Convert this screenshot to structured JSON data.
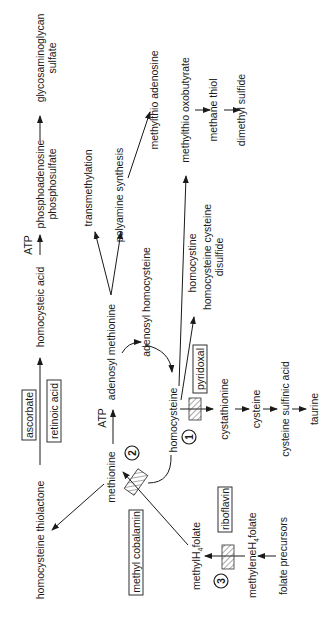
{
  "diagram": {
    "orientation": "rotated-90-ccw",
    "nodes": {
      "glycosaminoglycan_sulfate_1": "glycosaminoglycan",
      "glycosaminoglycan_sulfate_2": "sulfate",
      "paps_1": "phosphoadenosine",
      "paps_2": "phosphosulfate",
      "homocysteic_acid": "homocysteic acid",
      "atp_top": "ATP",
      "ascorbate": "ascorbate",
      "retinoic_acid": "retinoic acid",
      "homocysteine_thiolactone": "homocysteine thiolactone",
      "transmethylation": "transmethylation",
      "polyamine_synthesis": "polyamine synthesis",
      "methylthio_adenosine": "methylthio adenosine",
      "methylthio_oxobutyrate": "methylthio oxobutyrate",
      "methane_thiol": "methane thiol",
      "dimethyl_sulfide": "dimethyl sulfide",
      "adenosyl_methionine": "adenosyl methionine",
      "atp_mid": "ATP",
      "methionine": "methionine",
      "adenosyl_homocysteine": "adenosyl homocysteine",
      "homocysteine": "homocysteine",
      "homocystine": "homocystine",
      "homocysteine_cysteine_disulfide_1": "homocysteine cysteine",
      "homocysteine_cysteine_disulfide_2": "disulfide",
      "pyridoxal": "pyridoxal",
      "cystathionine": "cystathionine",
      "cysteine": "cysteine",
      "cysteine_sulfinic_acid": "cysteine sulfinic acid",
      "taurine": "taurine",
      "methyl_cobalamin": "methyl cobalamin",
      "riboflavin": "riboflavin",
      "methyl_h4_folate_a": "methylH",
      "methyl_h4_folate_sub": "4",
      "methyl_h4_folate_b": "folate",
      "methylene_h4_folate_a": "methyleneH",
      "methylene_h4_folate_sub": "4",
      "methylene_h4_folate_b": "folate",
      "folate_precursors": "folate precursors"
    },
    "enzyme_markers": {
      "one": "1",
      "two": "2",
      "three": "3"
    },
    "cofactor_boxes": [
      "ascorbate",
      "retinoic acid",
      "pyridoxal",
      "methyl cobalamin",
      "riboflavin"
    ]
  }
}
